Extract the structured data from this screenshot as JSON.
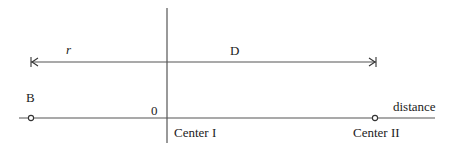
{
  "diagram": {
    "labels": {
      "r": "r",
      "D": "D",
      "B": "B",
      "origin": "0",
      "center1": "Center I",
      "center2": "Center II",
      "axis": "distance"
    },
    "colors": {
      "line": "#444444",
      "text": "#222222",
      "background": "#ffffff"
    }
  }
}
